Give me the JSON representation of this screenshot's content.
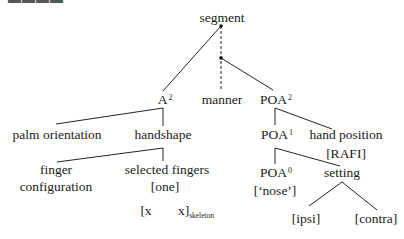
{
  "figure": {
    "cut_label": "▬▬▬▬",
    "root": {
      "label": "segment"
    },
    "nodes": {
      "a": {
        "label": "A",
        "sup": "2"
      },
      "manner": {
        "label": "manner"
      },
      "poa2": {
        "label": "POA",
        "sup": "2"
      },
      "palm": {
        "label": "palm orientation"
      },
      "handshape": {
        "label": "handshape"
      },
      "poa1": {
        "label": "POA",
        "sup": "1"
      },
      "hand_position": {
        "label": "hand position",
        "value": "[RAFI]"
      },
      "finger_config": {
        "line1": "finger",
        "line2": "configuration"
      },
      "selected_fingers": {
        "label": "selected fingers",
        "value": "[one]"
      },
      "poa0": {
        "label": "POA",
        "sup": "0",
        "value": "[‘nose’]"
      },
      "setting": {
        "label": "setting"
      },
      "ipsi": {
        "label": "[ipsi]"
      },
      "contra": {
        "label": "[contra]"
      },
      "skeleton": {
        "left": "[x",
        "right": "x]",
        "sub": "skeleton"
      }
    }
  }
}
